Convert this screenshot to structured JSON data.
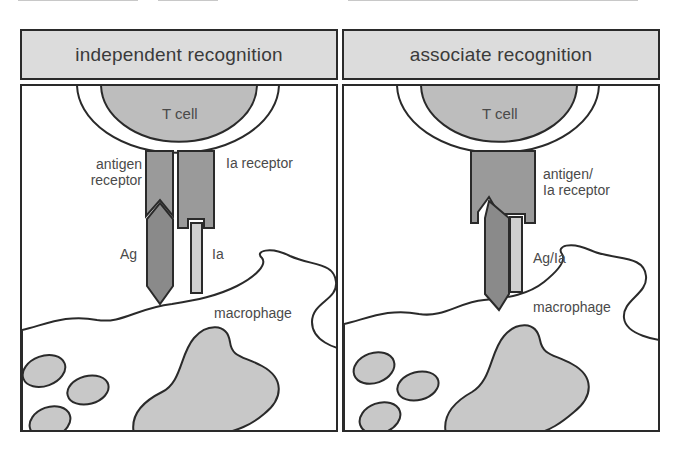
{
  "figure": {
    "colors": {
      "header_fill": "#dcdcdc",
      "outline": "#2a2a2a",
      "tcell_fill": "#bdbdbd",
      "receptor_fill": "#9a9a9a",
      "antigen_fill": "#8a8a8a",
      "ia_fill": "#cfcfcf",
      "nucleus_fill": "#c8c8c8",
      "background": "#ffffff"
    },
    "panels": [
      {
        "title": "independent recognition",
        "labels": {
          "tcell": "T cell",
          "antigen_receptor_line1": "antigen",
          "antigen_receptor_line2": "receptor",
          "ia_receptor": "Ia receptor",
          "antigen": "Ag",
          "ia": "Ia",
          "macrophage": "macrophage"
        }
      },
      {
        "title": "associate recognition",
        "labels": {
          "tcell": "T cell",
          "combined_receptor_line1": "antigen/",
          "combined_receptor_line2": "Ia receptor",
          "complex": "Ag/Ia",
          "macrophage": "macrophage"
        }
      }
    ]
  }
}
